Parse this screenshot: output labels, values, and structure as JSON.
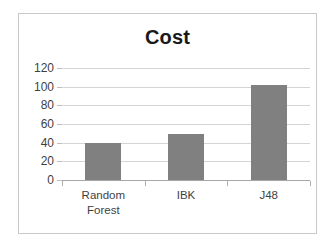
{
  "chart_data": {
    "type": "bar",
    "title": "Cost",
    "xlabel": "",
    "ylabel": "",
    "categories": [
      "Random Forest",
      "IBK",
      "J48"
    ],
    "category_lines": [
      [
        "Random",
        "Forest"
      ],
      [
        "IBK"
      ],
      [
        "J48"
      ]
    ],
    "values": [
      40,
      49,
      102
    ],
    "ylim": [
      0,
      120
    ],
    "yticks": [
      0,
      20,
      40,
      60,
      80,
      100,
      120
    ],
    "ytick_labels": [
      "0",
      "20",
      "40",
      "60",
      "80",
      "100",
      "120"
    ],
    "grid": true,
    "legend": false,
    "bar_color": "#808080",
    "gridline_color": "#d4d4d4",
    "axis_color": "#a6a6a6",
    "title_color": "#1a1a1a",
    "label_color": "#3f3f3f",
    "background_color": "#ffffff",
    "border_color": "#c9c9c9"
  }
}
